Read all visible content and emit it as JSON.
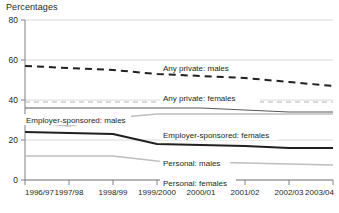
{
  "chart_data": {
    "type": "line",
    "title": "Percentages",
    "xlabel": "",
    "ylabel": "Percentages",
    "grid": true,
    "legend_position": "inline-annotations",
    "categories": [
      "1996/97",
      "1997/98",
      "1998/99",
      "1999/2000",
      "2000/01",
      "2001/02",
      "2002/03",
      "2003/04"
    ],
    "ylim": [
      0,
      80
    ],
    "yticks": [
      0,
      20,
      40,
      60,
      80
    ],
    "series": [
      {
        "name": "Any private: males",
        "label": "Any private: males",
        "style": "dashed",
        "color": "#231f20",
        "width": 2,
        "values": [
          57,
          56,
          55,
          53,
          52,
          51,
          49,
          47
        ]
      },
      {
        "name": "Any private: females",
        "label": "Any private: females",
        "style": "dashed",
        "color": "#b3b3b3",
        "width": 1.2,
        "values": [
          39,
          39,
          39,
          39,
          39,
          39,
          39,
          39
        ]
      },
      {
        "name": "Employer-sponsored: males",
        "label": "Employer-sponsored: males",
        "style": "solid",
        "color": "#58595b",
        "width": 1.2,
        "values": [
          36,
          36,
          36,
          36,
          36,
          35,
          34,
          34
        ]
      },
      {
        "name": "Employer-sponsored: females",
        "label": "Employer-sponsored: females",
        "style": "solid",
        "color": "#bcbec0",
        "width": 1.4,
        "values": [
          29,
          27,
          31,
          33,
          33,
          33,
          33,
          33
        ]
      },
      {
        "name": "Personal: males",
        "label": "Personal: males",
        "style": "solid",
        "color": "#231f20",
        "width": 2,
        "values": [
          24,
          23.5,
          23,
          18,
          17.5,
          17,
          16,
          16
        ]
      },
      {
        "name": "Personal: females",
        "label": "Personal: females",
        "style": "solid",
        "color": "#bcbec0",
        "width": 1.4,
        "values": [
          12,
          12,
          12,
          9.5,
          9,
          8.5,
          8,
          7.5
        ]
      }
    ]
  },
  "axes": {
    "y_title": "Percentages",
    "y_ticks": [
      "80",
      "60",
      "40",
      "20",
      "0"
    ],
    "x_ticks": [
      "1996/97",
      "1997/98",
      "1998/99",
      "1999/2000",
      "2000/01",
      "2001/02",
      "2002/03",
      "2003/04"
    ]
  },
  "annotations": {
    "any_private_males": "Any private: males",
    "any_private_females": "Any private: females",
    "employer_males": "Employer-sponsored: males",
    "employer_females": "Employer-sponsored: females",
    "personal_males": "Personal: males",
    "personal_females": "Personal: females"
  },
  "colors": {
    "text": "#231f20",
    "grid": "#d9d9d9",
    "axis": "#808080",
    "dark_series": "#231f20",
    "mid_series": "#58595b",
    "light_series": "#bcbec0"
  }
}
